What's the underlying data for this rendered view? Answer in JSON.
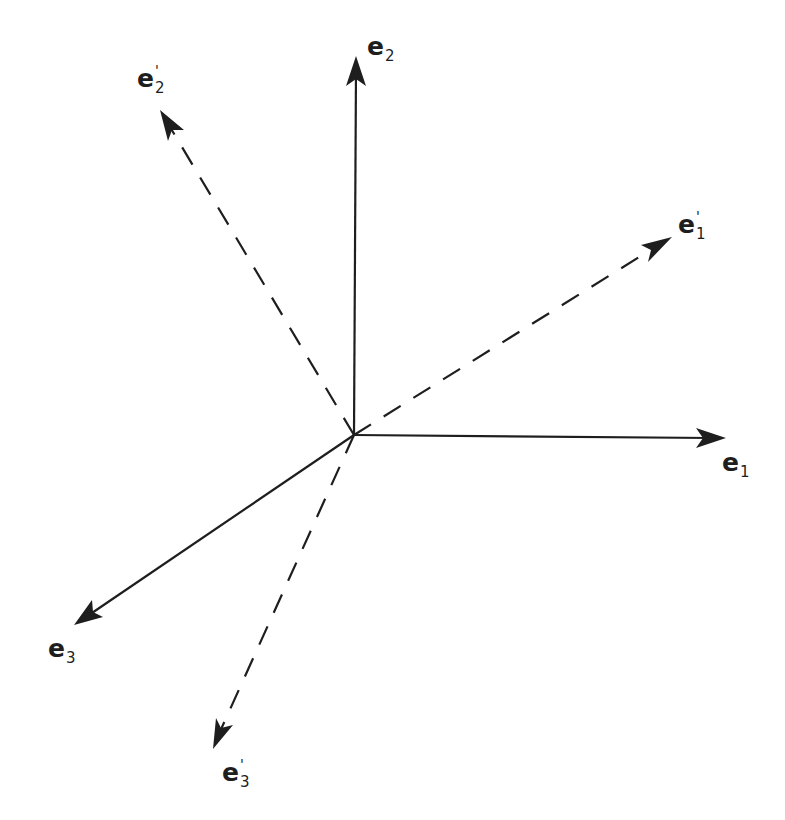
{
  "figure": {
    "origin": {
      "x": 354,
      "y": 435
    },
    "stroke_color": "#1e1e1e",
    "background_color": "#ffffff"
  },
  "vectors": {
    "e1": {
      "style": "solid",
      "tip": {
        "x": 726,
        "y": 438
      },
      "label": {
        "base": "e",
        "sub": "1",
        "prime": ""
      }
    },
    "e2": {
      "style": "solid",
      "tip": {
        "x": 356,
        "y": 56
      },
      "label": {
        "base": "e",
        "sub": "2",
        "prime": ""
      }
    },
    "e3": {
      "style": "solid",
      "tip": {
        "x": 74,
        "y": 625
      },
      "label": {
        "base": "e",
        "sub": "3",
        "prime": ""
      }
    },
    "e1_prime": {
      "style": "dashed",
      "tip": {
        "x": 672,
        "y": 237
      },
      "label": {
        "base": "e",
        "sub": "1",
        "prime": "'"
      }
    },
    "e2_prime": {
      "style": "dashed",
      "tip": {
        "x": 160,
        "y": 110
      },
      "label": {
        "base": "e",
        "sub": "2",
        "prime": "'"
      }
    },
    "e3_prime": {
      "style": "dashed",
      "tip": {
        "x": 213,
        "y": 749
      },
      "label": {
        "base": "e",
        "sub": "3",
        "prime": "'"
      }
    }
  }
}
